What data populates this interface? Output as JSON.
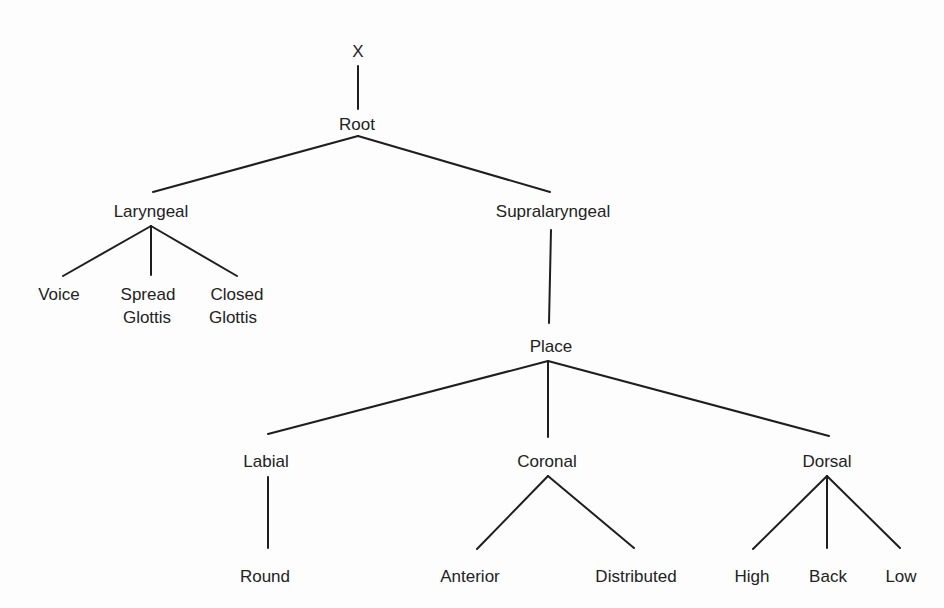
{
  "diagram": {
    "type": "feature-geometry-tree",
    "nodes": {
      "x": {
        "label": "X"
      },
      "root": {
        "label": "Root"
      },
      "laryngeal": {
        "label": "Laryngeal"
      },
      "supralaryngeal": {
        "label": "Supralaryngeal"
      },
      "voice": {
        "label": "Voice"
      },
      "spread_glottis": {
        "line1": "Spread",
        "line2": "Glottis"
      },
      "closed_glottis": {
        "line1": "Closed",
        "line2": "Glottis"
      },
      "place": {
        "label": "Place"
      },
      "labial": {
        "label": "Labial"
      },
      "coronal": {
        "label": "Coronal"
      },
      "dorsal": {
        "label": "Dorsal"
      },
      "round": {
        "label": "Round"
      },
      "anterior": {
        "label": "Anterior"
      },
      "distributed": {
        "label": "Distributed"
      },
      "high": {
        "label": "High"
      },
      "back": {
        "label": "Back"
      },
      "low": {
        "label": "Low"
      }
    },
    "edges": [
      [
        "X",
        "Root"
      ],
      [
        "Root",
        "Laryngeal"
      ],
      [
        "Root",
        "Supralaryngeal"
      ],
      [
        "Laryngeal",
        "Voice"
      ],
      [
        "Laryngeal",
        "Spread Glottis"
      ],
      [
        "Laryngeal",
        "Closed Glottis"
      ],
      [
        "Supralaryngeal",
        "Place"
      ],
      [
        "Place",
        "Labial"
      ],
      [
        "Place",
        "Coronal"
      ],
      [
        "Place",
        "Dorsal"
      ],
      [
        "Labial",
        "Round"
      ],
      [
        "Coronal",
        "Anterior"
      ],
      [
        "Coronal",
        "Distributed"
      ],
      [
        "Dorsal",
        "High"
      ],
      [
        "Dorsal",
        "Back"
      ],
      [
        "Dorsal",
        "Low"
      ]
    ]
  }
}
